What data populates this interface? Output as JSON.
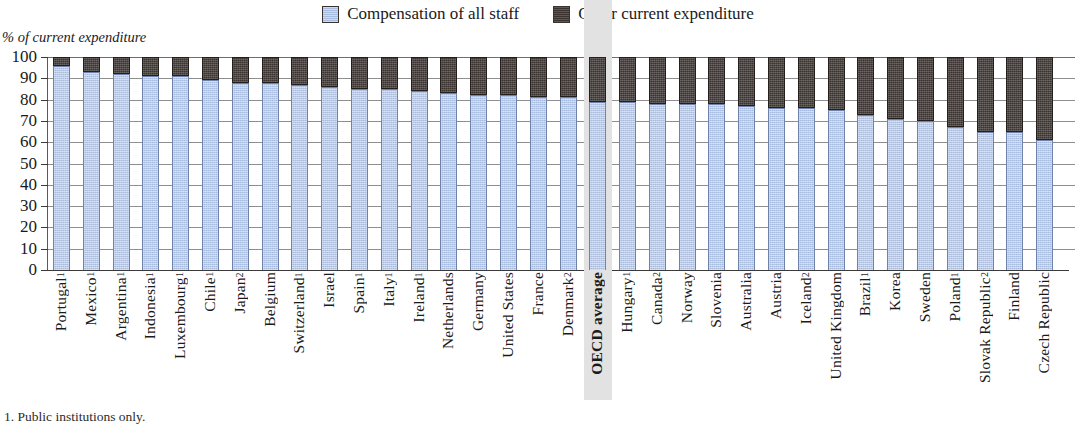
{
  "legend": {
    "position": "top-center",
    "items": [
      {
        "label": "Compensation of all staff",
        "color": "#a8bce0",
        "swatch": "blue"
      },
      {
        "label": "Other current expenditure",
        "color": "#3a3330",
        "swatch": "dark"
      }
    ]
  },
  "axis": {
    "y_caption": "% of current expenditure",
    "y_ticks": [
      "0",
      "10",
      "20",
      "30",
      "40",
      "50",
      "60",
      "70",
      "80",
      "90",
      "100"
    ]
  },
  "footnote": "1. Public institutions only.",
  "chart_data": {
    "type": "bar",
    "stacked": true,
    "title": "",
    "subtitle": "",
    "xlabel": "",
    "ylabel": "% of current expenditure",
    "ylim": [
      0,
      100
    ],
    "ytick_step": 10,
    "grid": true,
    "legend_position": "top-center",
    "highlight_category": "OECD average",
    "categories": [
      "Portugal",
      "Mexico",
      "Argentina",
      "Indonesia",
      "Luxembourg",
      "Chile",
      "Japan",
      "Belgium",
      "Switzerland",
      "Israel",
      "Spain",
      "Italy",
      "Ireland",
      "Netherlands",
      "Germany",
      "United States",
      "France",
      "Denmark",
      "OECD average",
      "Hungary",
      "Canada",
      "Norway",
      "Slovenia",
      "Australia",
      "Austria",
      "Iceland",
      "United Kingdom",
      "Brazil",
      "Korea",
      "Sweden",
      "Poland",
      "Slovak Republic",
      "Finland",
      "Czech Republic"
    ],
    "category_footnote_marks": [
      "1",
      "1",
      "1",
      "1",
      "1",
      "1",
      "2",
      "",
      "1",
      "",
      "1",
      "1",
      "1",
      "",
      "",
      "",
      "",
      "2",
      "",
      "1",
      "2",
      "",
      "",
      "",
      "",
      "2",
      "",
      "1",
      "",
      "",
      "1",
      "2",
      "",
      ""
    ],
    "series": [
      {
        "name": "Compensation of all staff",
        "color": "#a8bce0",
        "values": [
          96,
          93,
          92,
          91,
          91,
          89,
          88,
          88,
          87,
          86,
          85,
          85,
          84,
          83,
          82,
          82,
          81,
          81,
          79,
          79,
          78,
          78,
          78,
          77,
          76,
          76,
          75,
          73,
          71,
          70,
          67,
          65,
          65,
          61
        ]
      },
      {
        "name": "Other current expenditure",
        "color": "#3a3330",
        "values": [
          4,
          7,
          8,
          9,
          9,
          11,
          12,
          12,
          13,
          14,
          15,
          15,
          16,
          17,
          18,
          18,
          19,
          19,
          21,
          21,
          22,
          22,
          22,
          23,
          24,
          24,
          25,
          27,
          29,
          30,
          33,
          35,
          35,
          39
        ]
      }
    ]
  }
}
